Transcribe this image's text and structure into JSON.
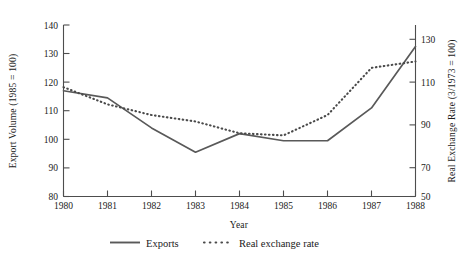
{
  "chart_data": {
    "type": "line",
    "title": "",
    "xlabel": "Year",
    "ylabel": "Export Volume (1985 = 100)",
    "y2label": "Real Exchange Rate (3/1973 = 100)",
    "grid": false,
    "legend_position": "bottom",
    "categories": [
      "1980",
      "1981",
      "1982",
      "1983",
      "1984",
      "1985",
      "1986",
      "1987",
      "1988"
    ],
    "x": [
      1980,
      1981,
      1982,
      1983,
      1984,
      1985,
      1986,
      1987,
      1988
    ],
    "xlim": [
      1980,
      1988
    ],
    "ylim": [
      80,
      140
    ],
    "y2lim": [
      50,
      130
    ],
    "yticks": [
      80,
      90,
      100,
      110,
      120,
      130,
      140
    ],
    "y2ticks": [
      50,
      70,
      90,
      110,
      130
    ],
    "xticks": [
      1980,
      1981,
      1982,
      1983,
      1984,
      1985,
      1986,
      1987,
      1988
    ],
    "series": [
      {
        "name": "Exports",
        "axis": "left",
        "style": "solid",
        "values": [
          117,
          114.5,
          104,
          95.5,
          102,
          99.5,
          99.5,
          111,
          132.5
        ]
      },
      {
        "name": "Real exchange rate",
        "axis": "right",
        "style": "dotted",
        "values": [
          101,
          93,
          88,
          85,
          79.5,
          78.5,
          88,
          110,
          113
        ]
      }
    ]
  },
  "axes": {
    "left_title": "Export Volume (1985 = 100)",
    "right_title": "Real Exchange Rate (3/1973 = 100)",
    "x_title": "Year",
    "left_ticks": [
      "140",
      "130",
      "120",
      "110",
      "100",
      "90",
      "80"
    ],
    "right_ticks": [
      "130",
      "110",
      "90",
      "70",
      "50"
    ],
    "x_ticks": [
      "1980",
      "1981",
      "1982",
      "1983",
      "1984",
      "1985",
      "1986",
      "1987",
      "1988"
    ]
  },
  "legend": {
    "items": [
      {
        "label": "Exports",
        "marker": "solid-line-swatch"
      },
      {
        "label": "Real exchange rate",
        "marker": "dotted-line-swatch"
      }
    ]
  },
  "colors": {
    "series_solid": "#595959",
    "series_dotted": "#4a4a4a",
    "axis": "#4d4d4a",
    "text": "#1a1a1a",
    "background": "#ffffff"
  }
}
